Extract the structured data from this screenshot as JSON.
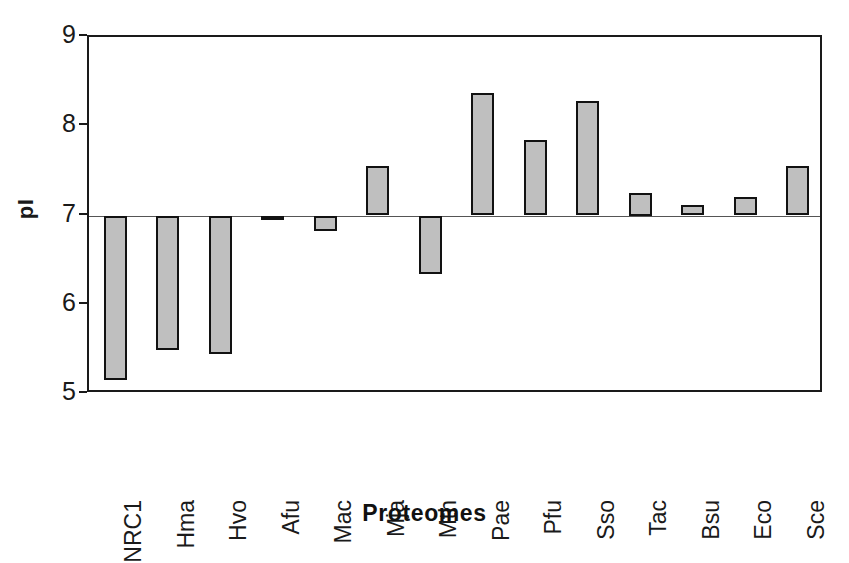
{
  "chart_data": {
    "type": "bar",
    "title": "",
    "xlabel": "Proteomes",
    "ylabel": "pI",
    "ylim": [
      5,
      9
    ],
    "yticks": [
      9,
      8,
      7,
      6,
      5
    ],
    "baseline": 7,
    "grid": false,
    "legend": null,
    "bar_color": "#bfbfbf",
    "bar_edge_color": "#121212",
    "categories": [
      "NRC1",
      "Hma",
      "Hvo",
      "Afu",
      "Mac",
      "Mja",
      "Mth",
      "Pae",
      "Pfu",
      "Sso",
      "Tac",
      "Bsu",
      "Eco",
      "Sce"
    ],
    "values": [
      5.16,
      5.49,
      5.45,
      6.97,
      6.83,
      7.56,
      6.35,
      8.37,
      7.85,
      8.28,
      7.25,
      7.12,
      7.21,
      7.56
    ]
  },
  "axes": {
    "y_title": "pI",
    "x_title": "Proteomes",
    "y_tick_labels": [
      "9",
      "8",
      "7",
      "6",
      "5"
    ],
    "x_tick_labels": [
      "NRC1",
      "Hma",
      "Hvo",
      "Afu",
      "Mac",
      "Mja",
      "Mth",
      "Pae",
      "Pfu",
      "Sso",
      "Tac",
      "Bsu",
      "Eco",
      "Sce"
    ]
  }
}
